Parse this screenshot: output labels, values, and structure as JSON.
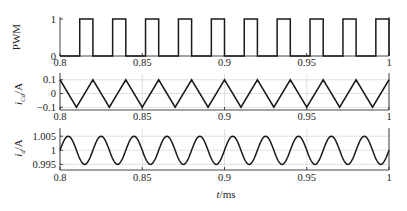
{
  "chart_data": [
    {
      "type": "line",
      "title": "",
      "ylabel": "PWM",
      "xlabel": "",
      "xlim": [
        0.8,
        1.0
      ],
      "ylim": [
        0,
        1
      ],
      "yticks": [
        0,
        1
      ],
      "ytick_labels": [
        "0",
        "1"
      ],
      "xticks": [
        0.8,
        0.85,
        0.9,
        0.95,
        1.0
      ],
      "xtick_labels": [
        "0.8",
        "0.85",
        "0.9",
        "0.95",
        "1"
      ],
      "grid": false,
      "series": [
        {
          "name": "PWM",
          "shape": "square",
          "period_ms": 0.02,
          "duty": 0.4,
          "rise_times_ms": [
            0.812,
            0.832,
            0.852,
            0.872,
            0.892,
            0.912,
            0.932,
            0.952,
            0.972,
            0.992
          ],
          "fall_times_ms": [
            0.82,
            0.84,
            0.86,
            0.88,
            0.9,
            0.92,
            0.94,
            0.96,
            0.98,
            1.0
          ],
          "low": 0,
          "high": 1
        }
      ]
    },
    {
      "type": "line",
      "title": "",
      "ylabel": "i_Cd/A",
      "xlabel": "",
      "xlim": [
        0.8,
        1.0
      ],
      "ylim": [
        -0.12,
        0.12
      ],
      "yticks": [
        -0.1,
        0,
        0.1
      ],
      "ytick_labels": [
        "-0.1",
        "0",
        "0.1"
      ],
      "xticks": [
        0.8,
        0.85,
        0.9,
        0.95,
        1.0
      ],
      "xtick_labels": [
        "0.8",
        "0.85",
        "0.9",
        "0.95",
        "1"
      ],
      "grid": true,
      "series": [
        {
          "name": "i_Cd",
          "shape": "triangle",
          "period_ms": 0.02,
          "peak_times_ms": [
            0.8,
            0.82,
            0.84,
            0.86,
            0.88,
            0.9,
            0.92,
            0.94,
            0.96,
            0.98,
            1.0
          ],
          "trough_times_ms": [
            0.81,
            0.83,
            0.85,
            0.87,
            0.89,
            0.91,
            0.93,
            0.95,
            0.97,
            0.99
          ],
          "peak": 0.1,
          "trough": -0.1
        }
      ]
    },
    {
      "type": "line",
      "title": "",
      "ylabel": "i_d/A",
      "xlabel": "t/ms",
      "xlim": [
        0.8,
        1.0
      ],
      "ylim": [
        0.993,
        1.0065
      ],
      "yticks": [
        0.995,
        1,
        1.005
      ],
      "ytick_labels": [
        "0.995",
        "1",
        "1.005"
      ],
      "xticks": [
        0.8,
        0.85,
        0.9,
        0.95,
        1.0
      ],
      "xtick_labels": [
        "0.8",
        "0.85",
        "0.9",
        "0.95",
        "1"
      ],
      "grid": true,
      "series": [
        {
          "name": "i_d",
          "shape": "sine",
          "period_ms": 0.02,
          "offset": 1.0,
          "amplitude": 0.005,
          "phase_note": "starts at 1.0 rising at t=0.8, peak near 0.805"
        }
      ]
    }
  ],
  "labels": {
    "pwm_ylabel": "PWM",
    "icd_ylabel_main": "i",
    "icd_ylabel_sub": "Cd",
    "icd_ylabel_unit": "/A",
    "id_ylabel_main": "i",
    "id_ylabel_sub": "d",
    "id_ylabel_unit": "/A",
    "xlabel_main": "t",
    "xlabel_unit": "/ms"
  }
}
